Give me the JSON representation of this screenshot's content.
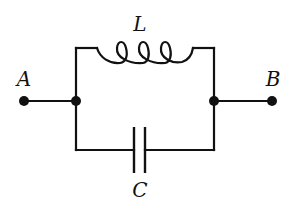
{
  "diagram": {
    "type": "circuit",
    "labels": {
      "inductor": "L",
      "capacitor": "C",
      "terminal_left": "A",
      "terminal_right": "B"
    },
    "components": [
      {
        "id": "L",
        "kind": "inductor",
        "branch": "top",
        "turns": 3
      },
      {
        "id": "C",
        "kind": "capacitor",
        "branch": "bottom"
      }
    ],
    "terminals": [
      "A",
      "B"
    ],
    "junctions": 2,
    "colors": {
      "ink": "#111111",
      "background": "#ffffff"
    }
  }
}
